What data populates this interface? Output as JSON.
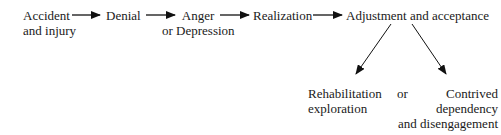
{
  "diagram": {
    "nodes": [
      {
        "id": "accident",
        "line1": "Accident",
        "line2": "and injury"
      },
      {
        "id": "denial",
        "line1": "Denial"
      },
      {
        "id": "anger",
        "line1": "Anger",
        "line2": "or Depression"
      },
      {
        "id": "realization",
        "line1": "Realization"
      },
      {
        "id": "adjustment",
        "line1": "Adjustment and acceptance"
      },
      {
        "id": "rehabilitation",
        "line1": "Rehabilitation",
        "line2": "exploration"
      },
      {
        "id": "contrived",
        "line1": "Contrived",
        "line2": "dependency",
        "line3": "and disengagement"
      }
    ],
    "connector_or": "or",
    "edges": [
      {
        "from": "accident",
        "to": "denial"
      },
      {
        "from": "denial",
        "to": "anger"
      },
      {
        "from": "anger",
        "to": "realization"
      },
      {
        "from": "realization",
        "to": "adjustment"
      },
      {
        "from": "adjustment",
        "to": "rehabilitation"
      },
      {
        "from": "adjustment",
        "to": "contrived"
      }
    ]
  }
}
